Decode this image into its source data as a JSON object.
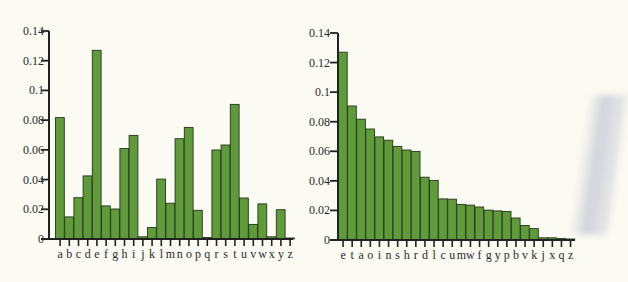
{
  "chart_data": [
    {
      "type": "bar",
      "title": "",
      "xlabel": "",
      "ylabel": "",
      "ylim": [
        0,
        0.14
      ],
      "yticks": [
        "0",
        "0.02",
        "0.04",
        "0.06",
        "0.08",
        "0.1",
        "0.12",
        "0.14"
      ],
      "grid": false,
      "order": "alphabetical",
      "categories": [
        "a",
        "b",
        "c",
        "d",
        "e",
        "f",
        "g",
        "h",
        "i",
        "j",
        "k",
        "l",
        "m",
        "n",
        "o",
        "p",
        "q",
        "r",
        "s",
        "t",
        "u",
        "v",
        "w",
        "x",
        "y",
        "z"
      ],
      "values": [
        0.0817,
        0.0149,
        0.0278,
        0.0425,
        0.127,
        0.0223,
        0.0202,
        0.0609,
        0.0697,
        0.0015,
        0.0077,
        0.0403,
        0.0241,
        0.0675,
        0.0751,
        0.0193,
        0.001,
        0.0599,
        0.0633,
        0.0906,
        0.0276,
        0.0098,
        0.0236,
        0.0015,
        0.0197,
        0.0007
      ]
    },
    {
      "type": "bar",
      "title": "",
      "xlabel": "",
      "ylabel": "",
      "ylim": [
        0,
        0.14
      ],
      "yticks": [
        "0",
        "0.02",
        "0.04",
        "0.06",
        "0.08",
        "0.1",
        "0.12",
        "0.14"
      ],
      "grid": false,
      "order": "by-frequency",
      "categories": [
        "e",
        "t",
        "a",
        "o",
        "i",
        "n",
        "s",
        "h",
        "r",
        "d",
        "l",
        "c",
        "u",
        "m",
        "w",
        "f",
        "g",
        "y",
        "p",
        "b",
        "v",
        "k",
        "j",
        "x",
        "q",
        "z"
      ],
      "values": [
        0.127,
        0.0906,
        0.0817,
        0.0751,
        0.0697,
        0.0675,
        0.0633,
        0.0609,
        0.0599,
        0.0425,
        0.0403,
        0.0278,
        0.0276,
        0.0241,
        0.0236,
        0.0223,
        0.0202,
        0.0197,
        0.0193,
        0.0149,
        0.0098,
        0.0077,
        0.0015,
        0.0015,
        0.001,
        0.0007
      ]
    }
  ],
  "colors": {
    "bar_fill": "#5f9a3b",
    "bar_stroke": "#27361a",
    "axis": "#222222",
    "background": "#fbfaf3"
  }
}
